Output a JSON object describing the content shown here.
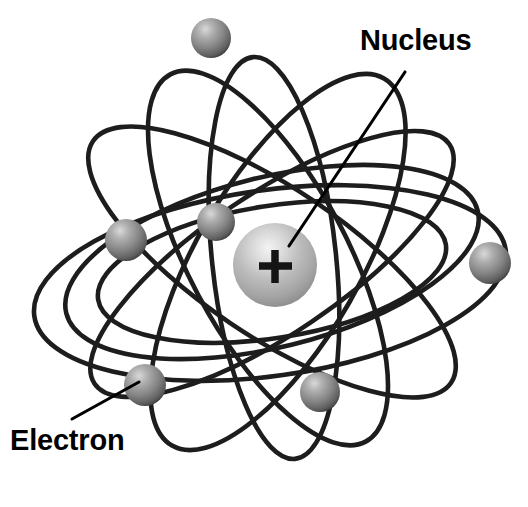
{
  "figure": {
    "background_color": "#ffffff",
    "width": 528,
    "height": 507
  },
  "labels": {
    "nucleus": "Nucleus",
    "electron": "Electron"
  },
  "nucleus": {
    "symbol": "+",
    "center": {
      "x": 275,
      "y": 265
    },
    "radius": 42,
    "highlight_color": "#f0f0f0",
    "mid_color": "#b4b4b4",
    "edge_color": "#8d8d8d",
    "symbol_color": "#141414"
  },
  "electrons": [
    {
      "name": "electron-top",
      "cx": 211,
      "cy": 38,
      "r": 20
    },
    {
      "name": "electron-upper-left",
      "cx": 126,
      "cy": 240,
      "r": 21
    },
    {
      "name": "electron-inner-left",
      "cx": 216,
      "cy": 222,
      "r": 19
    },
    {
      "name": "electron-right",
      "cx": 490,
      "cy": 263,
      "r": 21
    },
    {
      "name": "electron-lower-left",
      "cx": 145,
      "cy": 385,
      "r": 21
    },
    {
      "name": "electron-lower-right",
      "cx": 320,
      "cy": 392,
      "r": 20
    }
  ],
  "electron_style": {
    "highlight_color": "#d8d8d8",
    "mid_color": "#9a9a9a",
    "edge_color": "#4a4a4a"
  },
  "orbits": [
    {
      "name": "orbit-wide-horizontal",
      "cx": 270,
      "cy": 283,
      "rx": 238,
      "ry": 93,
      "rotation": -8
    },
    {
      "name": "orbit-inner-horizontal",
      "cx": 272,
      "cy": 272,
      "rx": 176,
      "ry": 66,
      "rotation": -9
    },
    {
      "name": "orbit-mid-horizontal",
      "cx": 272,
      "cy": 262,
      "rx": 212,
      "ry": 85,
      "rotation": -14
    },
    {
      "name": "orbit-steep-left",
      "cx": 268,
      "cy": 258,
      "rx": 208,
      "ry": 79,
      "rotation": 62
    },
    {
      "name": "orbit-steep-right",
      "cx": 278,
      "cy": 262,
      "rx": 212,
      "ry": 82,
      "rotation": -60
    },
    {
      "name": "orbit-diagonal-a",
      "cx": 272,
      "cy": 262,
      "rx": 216,
      "ry": 74,
      "rotation": 34
    },
    {
      "name": "orbit-diagonal-b",
      "cx": 272,
      "cy": 264,
      "rx": 214,
      "ry": 70,
      "rotation": -34
    },
    {
      "name": "orbit-vertical",
      "cx": 274,
      "cy": 258,
      "rx": 202,
      "ry": 62,
      "rotation": 84
    }
  ],
  "leader_lines": [
    {
      "name": "nucleus-leader",
      "x1": 405,
      "y1": 72,
      "x2": 289,
      "y2": 246
    },
    {
      "name": "electron-leader",
      "x1": 72,
      "y1": 419,
      "x2": 139,
      "y2": 382
    }
  ],
  "label_positions": {
    "nucleus": {
      "x": 360,
      "y": 50
    },
    "electron": {
      "x": 10,
      "y": 450
    }
  },
  "colors": {
    "stroke": "#1d1d1d",
    "text": "#000000",
    "background": "#ffffff"
  }
}
